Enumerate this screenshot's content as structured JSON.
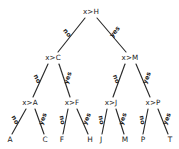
{
  "diagram": {
    "background_color": "#ffffff",
    "stroke_color": "#2b2b2b",
    "text_color": "#1d1d1d"
  },
  "chart_data": {
    "type": "diagram",
    "subtype": "binary-decision-tree",
    "edge_labels": {
      "left": "no",
      "right": "yes"
    },
    "nodes": [
      {
        "id": "n0",
        "label": "x>H",
        "kind": "internal",
        "depth": 0,
        "x": 91,
        "y": 12
      },
      {
        "id": "n1",
        "label": "x>C",
        "kind": "internal",
        "depth": 1,
        "x": 53,
        "y": 58
      },
      {
        "id": "n2",
        "label": "x>M",
        "kind": "internal",
        "depth": 1,
        "x": 130,
        "y": 58
      },
      {
        "id": "n3",
        "label": "x>A",
        "kind": "internal",
        "depth": 2,
        "x": 30,
        "y": 103
      },
      {
        "id": "n4",
        "label": "x>F",
        "kind": "internal",
        "depth": 2,
        "x": 72,
        "y": 103
      },
      {
        "id": "n5",
        "label": "x>J",
        "kind": "internal",
        "depth": 2,
        "x": 111,
        "y": 103
      },
      {
        "id": "n6",
        "label": "x>P",
        "kind": "internal",
        "depth": 2,
        "x": 153,
        "y": 103
      },
      {
        "id": "l0",
        "label": "A",
        "kind": "leaf",
        "depth": 3,
        "x": 10,
        "y": 140
      },
      {
        "id": "l1",
        "label": "C",
        "kind": "leaf",
        "depth": 3,
        "x": 45,
        "y": 140
      },
      {
        "id": "l2",
        "label": "F",
        "kind": "leaf",
        "depth": 3,
        "x": 62,
        "y": 140
      },
      {
        "id": "l3",
        "label": "H",
        "kind": "leaf",
        "depth": 3,
        "x": 90,
        "y": 140
      },
      {
        "id": "l4",
        "label": "J",
        "kind": "leaf",
        "depth": 3,
        "x": 101,
        "y": 140
      },
      {
        "id": "l5",
        "label": "M",
        "kind": "leaf",
        "depth": 3,
        "x": 125,
        "y": 140
      },
      {
        "id": "l6",
        "label": "P",
        "kind": "leaf",
        "depth": 3,
        "x": 143,
        "y": 140
      },
      {
        "id": "l7",
        "label": "T",
        "kind": "leaf",
        "depth": 3,
        "x": 170,
        "y": 140
      }
    ],
    "edges": [
      {
        "from": "n0",
        "to": "n1",
        "label": "no",
        "x1": 85,
        "y1": 18,
        "x2": 58,
        "y2": 52,
        "lx": 67,
        "ly": 33,
        "rot": 52
      },
      {
        "from": "n0",
        "to": "n2",
        "label": "yes",
        "x1": 97,
        "y1": 18,
        "x2": 126,
        "y2": 52,
        "lx": 115,
        "ly": 32,
        "rot": -50
      },
      {
        "from": "n1",
        "to": "n3",
        "label": "no",
        "x1": 48,
        "y1": 64,
        "x2": 33,
        "y2": 97,
        "lx": 37,
        "ly": 79,
        "rot": 66
      },
      {
        "from": "n1",
        "to": "n4",
        "label": "yes",
        "x1": 59,
        "y1": 64,
        "x2": 70,
        "y2": 97,
        "lx": 68,
        "ly": 78,
        "rot": -72
      },
      {
        "from": "n2",
        "to": "n5",
        "label": "no",
        "x1": 125,
        "y1": 64,
        "x2": 113,
        "y2": 97,
        "lx": 116,
        "ly": 79,
        "rot": 70
      },
      {
        "from": "n2",
        "to": "n6",
        "label": "yes",
        "x1": 136,
        "y1": 64,
        "x2": 150,
        "y2": 97,
        "lx": 147,
        "ly": 78,
        "rot": -68
      },
      {
        "from": "n3",
        "to": "l0",
        "label": "no",
        "x1": 26,
        "y1": 109,
        "x2": 12,
        "y2": 134,
        "lx": 15,
        "ly": 120,
        "rot": 62
      },
      {
        "from": "n3",
        "to": "l1",
        "label": "yes",
        "x1": 35,
        "y1": 109,
        "x2": 44,
        "y2": 134,
        "lx": 43,
        "ly": 119,
        "rot": -70
      },
      {
        "from": "n4",
        "to": "l2",
        "label": "no",
        "x1": 68,
        "y1": 109,
        "x2": 63,
        "y2": 134,
        "lx": 62,
        "ly": 120,
        "rot": 79
      },
      {
        "from": "n4",
        "to": "l3",
        "label": "yes",
        "x1": 77,
        "y1": 109,
        "x2": 88,
        "y2": 134,
        "lx": 87,
        "ly": 119,
        "rot": -66
      },
      {
        "from": "n5",
        "to": "l4",
        "label": "no",
        "x1": 107,
        "y1": 109,
        "x2": 102,
        "y2": 134,
        "lx": 101,
        "ly": 120,
        "rot": 79
      },
      {
        "from": "n5",
        "to": "l5",
        "label": "yes",
        "x1": 116,
        "y1": 109,
        "x2": 124,
        "y2": 134,
        "lx": 123,
        "ly": 119,
        "rot": -72
      },
      {
        "from": "n6",
        "to": "l6",
        "label": "no",
        "x1": 148,
        "y1": 109,
        "x2": 143,
        "y2": 134,
        "lx": 142,
        "ly": 120,
        "rot": 79
      },
      {
        "from": "n6",
        "to": "l7",
        "label": "yes",
        "x1": 158,
        "y1": 109,
        "x2": 168,
        "y2": 134,
        "lx": 167,
        "ly": 119,
        "rot": -68
      }
    ]
  }
}
